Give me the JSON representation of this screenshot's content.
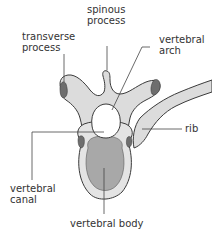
{
  "diagram": {
    "colors": {
      "bone_fill": "#dcdcdc",
      "bone_stroke": "#3a3a3a",
      "body_fill": "#a8a8a8",
      "facet_fill": "#6e6e6e",
      "canal_fill": "#ffffff",
      "leader_line": "#444444",
      "text": "#333333"
    },
    "labels": {
      "spinous_process": {
        "line1": "spinous",
        "line2": "process"
      },
      "transverse_process": {
        "line1": "transverse",
        "line2": "process"
      },
      "vertebral_arch": {
        "line1": "vertebral",
        "line2": "arch"
      },
      "rib": {
        "line1": "rib"
      },
      "vertebral_canal": {
        "line1": "vertebral",
        "line2": "canal"
      },
      "vertebral_body": {
        "line1": "vertebral body"
      }
    }
  }
}
